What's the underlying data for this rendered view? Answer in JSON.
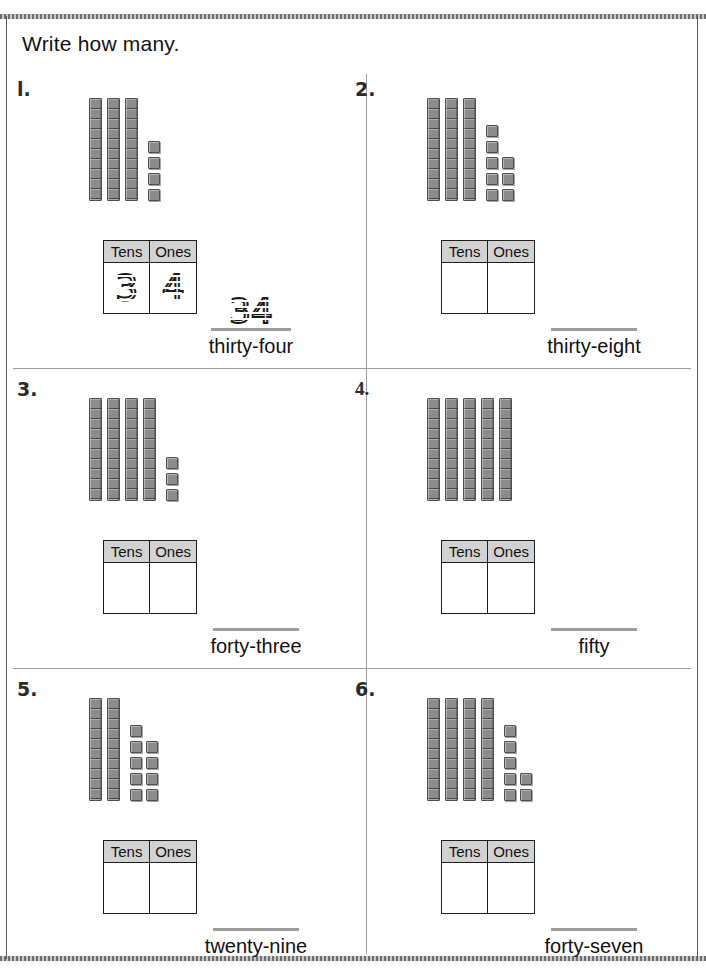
{
  "worksheet": {
    "directions": "Write how many.",
    "table_headers": {
      "tens": "Tens",
      "ones": "Ones"
    },
    "colors": {
      "block_fill": "#8c8c8c",
      "block_border": "#4f4f4f",
      "table_header_fill": "#d2d2d2",
      "table_border": "#1d1d1d",
      "answer_line": "#9d9d9d",
      "divider": "#9a9a9a",
      "page_border": "#5a5a5a"
    }
  },
  "problems": [
    {
      "number": "l.",
      "tens": 3,
      "ones": 4,
      "ones_columns": [
        4
      ],
      "tens_value": "3",
      "ones_value": "4",
      "answer_number": "34",
      "answer_word": "thirty-four",
      "filled": true
    },
    {
      "number": "2.",
      "tens": 3,
      "ones": 8,
      "ones_columns": [
        5,
        3
      ],
      "tens_value": "",
      "ones_value": "",
      "answer_number": "",
      "answer_word": "thirty-eight",
      "filled": false
    },
    {
      "number": "3.",
      "tens": 4,
      "ones": 3,
      "ones_columns": [
        3
      ],
      "tens_value": "",
      "ones_value": "",
      "answer_number": "",
      "answer_word": "forty-three",
      "filled": false
    },
    {
      "number": "4.",
      "tens": 5,
      "ones": 0,
      "ones_columns": [],
      "tens_value": "",
      "ones_value": "",
      "answer_number": "",
      "answer_word": "fifty",
      "filled": false
    },
    {
      "number": "5.",
      "tens": 2,
      "ones": 9,
      "ones_columns": [
        5,
        4
      ],
      "tens_value": "",
      "ones_value": "",
      "answer_number": "",
      "answer_word": "twenty-nine",
      "filled": false
    },
    {
      "number": "6.",
      "tens": 4,
      "ones": 7,
      "ones_columns": [
        5,
        2
      ],
      "tens_value": "",
      "ones_value": "",
      "answer_number": "",
      "answer_word": "forty-seven",
      "filled": false
    }
  ]
}
